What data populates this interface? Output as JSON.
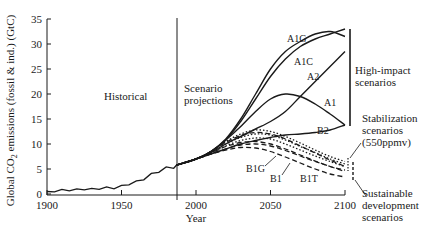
{
  "chart_data": {
    "type": "line",
    "title": "",
    "xlabel": "Year",
    "ylabel": "Global CO₂ emissions (fossil & ind.) (GtC)",
    "xlim": [
      1900,
      2100
    ],
    "ylim": [
      0,
      35
    ],
    "x_ticks": [
      1900,
      1950,
      2000,
      2050,
      2100
    ],
    "y_ticks": [
      0,
      5,
      10,
      15,
      20,
      25,
      30,
      35
    ],
    "grid": false,
    "legend": "none (inline labels)",
    "divider_year": 1987,
    "region_labels": {
      "historical": "Historical",
      "projections": [
        "Scenario",
        "projections"
      ]
    },
    "group_labels": {
      "high_impact": [
        "High-impact",
        "scenarios"
      ],
      "stabilization": [
        "Stabilization",
        "scenarios",
        "(550ppmv)"
      ],
      "sustainable": [
        "Sustainable",
        "development",
        "scenarios"
      ]
    },
    "historical": {
      "x": [
        1900,
        1905,
        1910,
        1915,
        1920,
        1925,
        1930,
        1935,
        1940,
        1945,
        1950,
        1955,
        1960,
        1965,
        1970,
        1975,
        1980,
        1985,
        1987
      ],
      "y": [
        0.5,
        0.6,
        0.8,
        0.8,
        0.9,
        1.0,
        1.0,
        1.1,
        1.3,
        1.2,
        1.6,
        2.0,
        2.5,
        3.0,
        4.0,
        4.5,
        5.3,
        5.3,
        5.8
      ]
    },
    "series": [
      {
        "name": "A1G",
        "style": "solid",
        "group": "high_impact",
        "x": [
          1987,
          2000,
          2010,
          2020,
          2030,
          2040,
          2050,
          2060,
          2070,
          2080,
          2090,
          2100
        ],
        "y": [
          5.8,
          7.0,
          8.5,
          11.0,
          15.0,
          20.0,
          25.0,
          28.5,
          30.5,
          32.0,
          32.5,
          31.5
        ]
      },
      {
        "name": "A1C",
        "style": "solid",
        "group": "high_impact",
        "x": [
          1987,
          2000,
          2010,
          2020,
          2030,
          2040,
          2050,
          2060,
          2070,
          2080,
          2090,
          2100
        ],
        "y": [
          5.8,
          7.0,
          8.5,
          10.8,
          14.5,
          19.0,
          23.5,
          27.0,
          29.5,
          31.0,
          32.0,
          33.0
        ]
      },
      {
        "name": "A2",
        "style": "solid",
        "group": "high_impact",
        "x": [
          1987,
          2000,
          2010,
          2020,
          2030,
          2040,
          2050,
          2060,
          2070,
          2080,
          2090,
          2100
        ],
        "y": [
          5.8,
          7.0,
          8.3,
          10.0,
          11.5,
          13.0,
          14.5,
          16.5,
          19.5,
          22.5,
          25.5,
          28.5
        ]
      },
      {
        "name": "A1",
        "style": "solid",
        "group": "high_impact",
        "x": [
          1987,
          2000,
          2010,
          2020,
          2030,
          2040,
          2050,
          2060,
          2070,
          2080,
          2090,
          2100
        ],
        "y": [
          5.8,
          7.0,
          8.5,
          10.8,
          13.5,
          16.5,
          19.0,
          20.0,
          19.5,
          18.0,
          16.0,
          13.8
        ]
      },
      {
        "name": "B2",
        "style": "solid",
        "group": "high_impact",
        "x": [
          1987,
          2000,
          2010,
          2020,
          2030,
          2040,
          2050,
          2060,
          2070,
          2080,
          2090,
          2100
        ],
        "y": [
          5.8,
          7.0,
          8.0,
          9.0,
          10.0,
          10.7,
          11.3,
          11.8,
          12.0,
          12.3,
          12.8,
          13.8
        ]
      },
      {
        "name": "Stabilization-1",
        "style": "dotted",
        "group": "stabilization",
        "x": [
          1987,
          2000,
          2010,
          2020,
          2030,
          2040,
          2050,
          2060,
          2070,
          2080,
          2090,
          2100
        ],
        "y": [
          5.8,
          7.0,
          8.5,
          10.5,
          12.0,
          12.8,
          12.5,
          11.5,
          10.2,
          8.8,
          7.5,
          6.5
        ]
      },
      {
        "name": "Stabilization-2",
        "style": "dotted",
        "group": "stabilization",
        "x": [
          1987,
          2000,
          2010,
          2020,
          2030,
          2040,
          2050,
          2060,
          2070,
          2080,
          2090,
          2100
        ],
        "y": [
          5.8,
          7.0,
          8.3,
          10.0,
          11.3,
          12.0,
          11.8,
          10.8,
          9.5,
          8.3,
          7.0,
          6.0
        ]
      },
      {
        "name": "Stabilization-3",
        "style": "dotted",
        "group": "stabilization",
        "x": [
          1987,
          2000,
          2010,
          2020,
          2030,
          2040,
          2050,
          2060,
          2070,
          2080,
          2090,
          2100
        ],
        "y": [
          5.8,
          7.0,
          8.2,
          9.6,
          10.7,
          11.2,
          11.0,
          10.0,
          8.8,
          7.6,
          6.5,
          5.5
        ]
      },
      {
        "name": "B1G",
        "style": "dashed",
        "group": "sustainable",
        "x": [
          1987,
          2000,
          2010,
          2020,
          2030,
          2040,
          2050,
          2060,
          2070,
          2080,
          2090,
          2100
        ],
        "y": [
          5.8,
          7.0,
          8.5,
          10.3,
          11.7,
          12.3,
          12.0,
          11.0,
          9.6,
          8.2,
          6.8,
          5.5
        ]
      },
      {
        "name": "B1",
        "style": "dashed",
        "group": "sustainable",
        "x": [
          1987,
          2000,
          2010,
          2020,
          2030,
          2040,
          2050,
          2060,
          2070,
          2080,
          2090,
          2100
        ],
        "y": [
          5.8,
          7.0,
          8.2,
          9.5,
          10.3,
          10.5,
          10.0,
          9.0,
          7.8,
          6.6,
          5.5,
          4.8
        ]
      },
      {
        "name": "B1-variant",
        "style": "dashed",
        "group": "sustainable",
        "x": [
          1987,
          2000,
          2010,
          2020,
          2030,
          2040,
          2050,
          2060,
          2070,
          2080,
          2090,
          2100
        ],
        "y": [
          5.8,
          7.0,
          8.0,
          9.0,
          9.8,
          10.0,
          9.6,
          8.7,
          7.6,
          6.5,
          5.5,
          4.5
        ]
      },
      {
        "name": "B1T",
        "style": "dashed",
        "group": "sustainable",
        "x": [
          1987,
          2000,
          2010,
          2020,
          2030,
          2040,
          2050,
          2060,
          2070,
          2080,
          2090,
          2100
        ],
        "y": [
          5.8,
          7.0,
          8.0,
          8.8,
          9.3,
          9.2,
          8.5,
          7.4,
          6.2,
          5.0,
          4.0,
          3.4
        ]
      }
    ]
  },
  "labels": {
    "A1G": "A1G",
    "A1C": "A1C",
    "A2": "A2",
    "A1": "A1",
    "B2": "B2",
    "B1G": "B1G",
    "B1": "B1",
    "B1T": "B1T"
  }
}
